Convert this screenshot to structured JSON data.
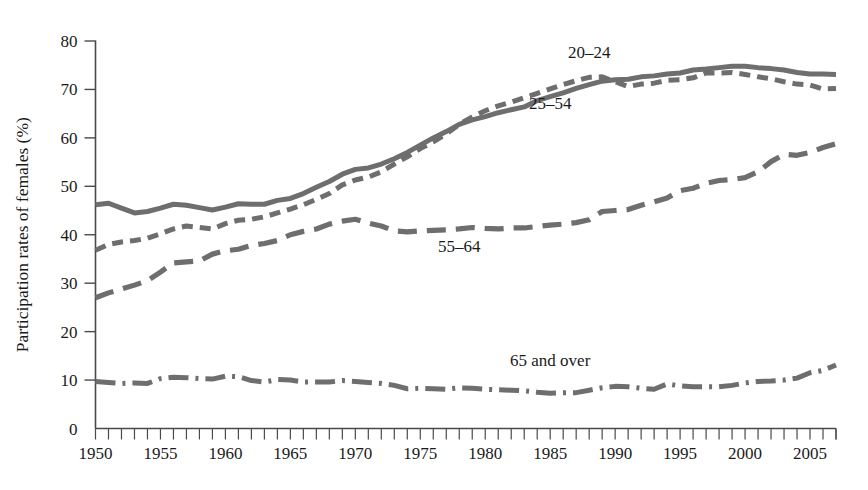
{
  "chart_data": {
    "type": "line",
    "title": "",
    "xlabel": "",
    "ylabel": "Participation rates of females (%)",
    "ylim": [
      0,
      80
    ],
    "xlim": [
      1950,
      2007
    ],
    "yticks": [
      0,
      10,
      20,
      30,
      40,
      50,
      60,
      70,
      80
    ],
    "xticks": [
      1950,
      1955,
      1960,
      1965,
      1970,
      1975,
      1980,
      1985,
      1990,
      1995,
      2000,
      2005
    ],
    "xtick_minor_step": 1,
    "grid": false,
    "legend_position": "inline-annotations",
    "line_color": "#6e6e6e",
    "x": [
      1950,
      1951,
      1952,
      1953,
      1954,
      1955,
      1956,
      1957,
      1958,
      1959,
      1960,
      1961,
      1962,
      1963,
      1964,
      1965,
      1966,
      1967,
      1968,
      1969,
      1970,
      1971,
      1972,
      1973,
      1974,
      1975,
      1976,
      1977,
      1978,
      1979,
      1980,
      1981,
      1982,
      1983,
      1984,
      1985,
      1986,
      1987,
      1988,
      1989,
      1990,
      1991,
      1992,
      1993,
      1994,
      1995,
      1996,
      1997,
      1998,
      1999,
      2000,
      2001,
      2002,
      2003,
      2004,
      2005,
      2006,
      2007
    ],
    "series": [
      {
        "name": "20-24",
        "label": "20–24",
        "style": "short-dash",
        "dasharray": "11 7",
        "width": 5.0,
        "label_x": 1988,
        "label_y": 76.5,
        "values": [
          36.8,
          38.0,
          38.5,
          38.8,
          39.3,
          40.2,
          41.2,
          41.8,
          41.5,
          41.2,
          42.3,
          43.0,
          43.2,
          43.7,
          44.5,
          45.3,
          46.2,
          47.3,
          48.5,
          50.3,
          51.3,
          51.9,
          53.0,
          54.6,
          56.1,
          57.8,
          59.2,
          60.8,
          62.8,
          64.3,
          65.6,
          66.6,
          67.4,
          68.3,
          69.2,
          70.1,
          71.0,
          71.8,
          72.5,
          72.6,
          71.6,
          70.6,
          71.1,
          71.3,
          71.9,
          72.0,
          72.4,
          73.4,
          73.4,
          73.5,
          73.1,
          72.6,
          72.2,
          71.6,
          71.1,
          70.9,
          70.1,
          70.2
        ],
        "note": "short-dashed line, labeled 20-24"
      },
      {
        "name": "25-54",
        "label": "25–54",
        "style": "solid",
        "dasharray": "none",
        "width": 5.0,
        "label_x": 1985,
        "label_y": 66.0,
        "values": [
          46.2,
          46.5,
          45.5,
          44.5,
          44.8,
          45.5,
          46.3,
          46.1,
          45.6,
          45.1,
          45.7,
          46.4,
          46.3,
          46.3,
          47.1,
          47.5,
          48.5,
          49.8,
          51.0,
          52.5,
          53.5,
          53.8,
          54.6,
          55.7,
          57.0,
          58.5,
          60.0,
          61.3,
          62.8,
          63.7,
          64.4,
          65.2,
          65.8,
          66.4,
          67.7,
          68.5,
          69.3,
          70.2,
          71.0,
          71.7,
          72.0,
          72.1,
          72.6,
          72.8,
          73.2,
          73.4,
          74.0,
          74.2,
          74.5,
          74.8,
          74.8,
          74.5,
          74.3,
          74.0,
          73.5,
          73.2,
          73.2,
          73.1
        ],
        "note": "solid line, labeled 25-54"
      },
      {
        "name": "55-64",
        "label": "55–64",
        "style": "long-dash",
        "dasharray": "19 10",
        "width": 5.2,
        "label_x": 1978,
        "label_y": 36.5,
        "values": [
          27.0,
          28.0,
          28.8,
          29.6,
          30.5,
          32.3,
          34.2,
          34.4,
          34.6,
          36.0,
          36.7,
          37.0,
          37.8,
          38.2,
          38.8,
          40.0,
          40.7,
          41.2,
          42.2,
          42.8,
          43.2,
          42.4,
          41.8,
          40.8,
          40.6,
          40.8,
          40.9,
          41.0,
          41.2,
          41.5,
          41.3,
          41.2,
          41.4,
          41.4,
          41.7,
          42.0,
          42.2,
          42.5,
          43.1,
          44.8,
          45.0,
          45.2,
          46.1,
          46.8,
          47.6,
          49.1,
          49.6,
          50.6,
          51.2,
          51.4,
          51.8,
          53.0,
          55.1,
          56.6,
          56.4,
          57.0,
          58.0,
          58.8
        ],
        "note": "long-dashed line, labeled 55-64"
      },
      {
        "name": "65 and over",
        "label": "65 and over",
        "style": "dash-dot",
        "dasharray": "20 7 3 7",
        "width": 5.0,
        "label_x": 1985,
        "label_y": 13.0,
        "values": [
          9.7,
          9.5,
          9.3,
          9.4,
          9.3,
          10.3,
          10.6,
          10.5,
          10.3,
          10.2,
          10.8,
          10.7,
          9.9,
          9.6,
          10.1,
          10.0,
          9.6,
          9.6,
          9.6,
          9.9,
          9.7,
          9.5,
          9.3,
          8.9,
          8.2,
          8.3,
          8.2,
          8.1,
          8.4,
          8.3,
          8.1,
          8.0,
          7.9,
          7.8,
          7.5,
          7.3,
          7.4,
          7.4,
          7.9,
          8.4,
          8.7,
          8.6,
          8.3,
          8.1,
          9.2,
          8.8,
          8.6,
          8.6,
          8.6,
          8.9,
          9.4,
          9.7,
          9.8,
          10.0,
          10.4,
          11.5,
          12.0,
          13.1
        ],
        "note": "dash-dot line, labeled 65 and over"
      }
    ]
  },
  "axes": {
    "y_axis_title": "Participation rates of females (%)",
    "y_tick_labels": [
      "0",
      "10",
      "20",
      "30",
      "40",
      "50",
      "60",
      "70",
      "80"
    ],
    "x_tick_labels": [
      "1950",
      "1955",
      "1960",
      "1965",
      "1970",
      "1975",
      "1980",
      "1985",
      "1990",
      "1995",
      "2000",
      "2005"
    ]
  }
}
